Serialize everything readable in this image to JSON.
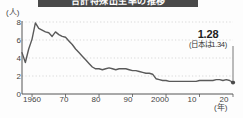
{
  "banner": {
    "title": "合計特殊出生率の推移"
  },
  "axis": {
    "y_unit": "(人)",
    "x_unit": "(年)",
    "y_ticks": [
      "8",
      "6",
      "4",
      "2",
      "0"
    ],
    "x_ticks": [
      "1960",
      "70",
      "80",
      "90",
      "2000",
      "10",
      "20"
    ]
  },
  "annotation": {
    "value": "1.28",
    "note": "(日本は1.34)"
  },
  "colors": {
    "line": "#5a5a5a",
    "axis": "#555555",
    "grid": "#c9c9c9",
    "banner": "#4a4a4a",
    "background": "#fdfdfd"
  },
  "chart_data": {
    "type": "line",
    "title": "合計特殊出生率の推移",
    "xlabel": "(年)",
    "ylabel": "(人)",
    "xlim": [
      1957,
      2020
    ],
    "ylim": [
      0,
      8
    ],
    "grid": true,
    "legend": "none",
    "series": [
      {
        "name": "合計特殊出生率",
        "x": [
          1957,
          1958,
          1959,
          1960,
          1961,
          1962,
          1963,
          1964,
          1965,
          1966,
          1967,
          1968,
          1969,
          1970,
          1971,
          1972,
          1973,
          1974,
          1975,
          1976,
          1977,
          1978,
          1979,
          1980,
          1981,
          1982,
          1983,
          1984,
          1985,
          1986,
          1987,
          1988,
          1989,
          1990,
          1991,
          1992,
          1993,
          1994,
          1995,
          1996,
          1997,
          1998,
          1999,
          2000,
          2001,
          2002,
          2003,
          2004,
          2005,
          2006,
          2007,
          2008,
          2009,
          2010,
          2011,
          2012,
          2013,
          2014,
          2015,
          2016,
          2017,
          2018,
          2019,
          2020
        ],
        "y": [
          4.6,
          3.5,
          5.0,
          6.1,
          7.9,
          7.3,
          7.1,
          6.9,
          6.8,
          6.4,
          6.9,
          6.6,
          6.4,
          6.3,
          5.9,
          5.5,
          5.0,
          4.6,
          4.2,
          3.8,
          3.4,
          3.0,
          2.8,
          2.8,
          2.7,
          2.8,
          2.9,
          2.8,
          2.7,
          2.8,
          2.8,
          2.8,
          2.7,
          2.6,
          2.6,
          2.5,
          2.4,
          2.3,
          2.3,
          2.2,
          1.7,
          1.6,
          1.5,
          1.5,
          1.4,
          1.4,
          1.4,
          1.4,
          1.4,
          1.4,
          1.4,
          1.4,
          1.4,
          1.5,
          1.5,
          1.5,
          1.5,
          1.5,
          1.6,
          1.6,
          1.5,
          1.6,
          1.5,
          1.28
        ]
      }
    ],
    "annotations": [
      {
        "x": 2020,
        "y": 1.28,
        "label": "1.28",
        "sublabel": "(日本は1.34)"
      }
    ]
  }
}
